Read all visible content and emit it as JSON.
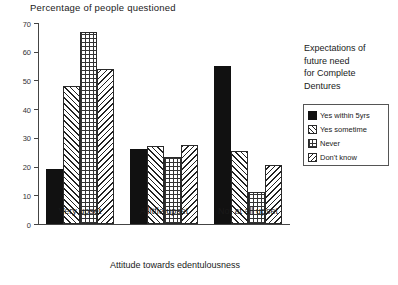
{
  "chart_data": {
    "type": "bar",
    "title": "Percentage of people questioned",
    "xlabel": "Attitude towards edentulousness",
    "ylabel": "",
    "ylim": [
      0,
      70
    ],
    "yticks": [
      0,
      10,
      20,
      30,
      40,
      50,
      60,
      70
    ],
    "ytick_labels": [
      "0",
      "10",
      "20",
      "30",
      "40",
      "50",
      "60",
      "70"
    ],
    "grid": false,
    "legend_position": "right",
    "categories": [
      "Very upset",
      "A little upset",
      "Not at all upset"
    ],
    "series": [
      {
        "name": "Yes within 5yrs",
        "pattern": "solid-black",
        "values": [
          19,
          26,
          55
        ]
      },
      {
        "name": "Yes sometime",
        "pattern": "diagonal-hatch",
        "values": [
          48,
          27,
          25.5
        ]
      },
      {
        "name": "Never",
        "pattern": "crosshatch-grid",
        "values": [
          67,
          23.5,
          11
        ]
      },
      {
        "name": "Don't know",
        "pattern": "back-diagonal-hatch",
        "values": [
          54,
          27.5,
          20.5
        ]
      }
    ]
  },
  "legend": {
    "heading": "Expectations of future need for Complete Dentures",
    "heading_lines": [
      "Expectations of",
      "future need",
      "for Complete",
      "Dentures"
    ],
    "items": [
      {
        "label": "Yes within 5yrs",
        "swatch": "solid-black-swatch"
      },
      {
        "label": "Yes sometime",
        "swatch": "diagonal-hatch-swatch"
      },
      {
        "label": "Never",
        "swatch": "crosshatch-grid-swatch"
      },
      {
        "label": "Don't know",
        "swatch": "back-diagonal-hatch-swatch"
      }
    ]
  }
}
